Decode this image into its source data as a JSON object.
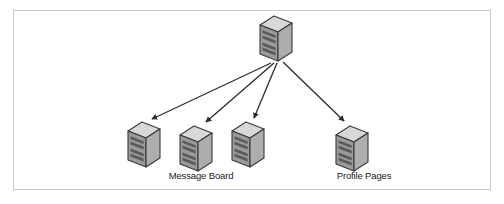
{
  "figure": {
    "kind": "network-topology-diagram",
    "title": "",
    "frame": {
      "visible": true,
      "border_color": "#c9c9c9",
      "background_color": "#ffffff",
      "x": 13,
      "y": 10,
      "width": 478,
      "height": 180
    },
    "palette": {
      "server_top_face": "#d8d8d8",
      "server_front_face": "#a8a8a8",
      "server_side_face": "#8f8f8f",
      "server_slot": "#5a5a5a",
      "server_outline": "#3a3a3a",
      "arrow_color": "#2b2b2b",
      "label_color": "#1a1a1a"
    },
    "nodes": [
      {
        "id": "origin-server",
        "role": "source",
        "icon": "server-icon",
        "label": "",
        "x": 256,
        "y": 14,
        "width": 40,
        "height": 48
      },
      {
        "id": "target-server-1",
        "role": "target",
        "icon": "server-icon",
        "label": "",
        "x": 124,
        "y": 120,
        "width": 40,
        "height": 48
      },
      {
        "id": "target-server-2",
        "role": "target",
        "icon": "server-icon",
        "label": "Message Board",
        "x": 176,
        "y": 124,
        "width": 40,
        "height": 48
      },
      {
        "id": "target-server-3",
        "role": "target",
        "icon": "server-icon",
        "label": "",
        "x": 228,
        "y": 120,
        "width": 40,
        "height": 48
      },
      {
        "id": "target-server-4",
        "role": "target",
        "icon": "server-icon",
        "label": "Profile Pages",
        "x": 332,
        "y": 124,
        "width": 40,
        "height": 48
      }
    ],
    "edges": [
      {
        "id": "edge-1",
        "from": "origin-server",
        "to": "target-server-1",
        "arrowhead": "filled-triangle",
        "x1": 271,
        "y1": 63,
        "x2": 150,
        "y2": 120
      },
      {
        "id": "edge-2",
        "from": "origin-server",
        "to": "target-server-2",
        "arrowhead": "filled-triangle",
        "x1": 274,
        "y1": 63,
        "x2": 204,
        "y2": 123
      },
      {
        "id": "edge-3",
        "from": "origin-server",
        "to": "target-server-3",
        "arrowhead": "filled-triangle",
        "x1": 277,
        "y1": 63,
        "x2": 252,
        "y2": 119
      },
      {
        "id": "edge-4",
        "from": "origin-server",
        "to": "target-server-4",
        "arrowhead": "filled-triangle",
        "x1": 283,
        "y1": 62,
        "x2": 344,
        "y2": 122
      }
    ],
    "labels": [
      {
        "id": "label-message-board",
        "text": "Message Board",
        "x": 198,
        "y": 176
      },
      {
        "id": "label-profile-pages",
        "text": "Profile Pages",
        "x": 364,
        "y": 176
      }
    ]
  }
}
